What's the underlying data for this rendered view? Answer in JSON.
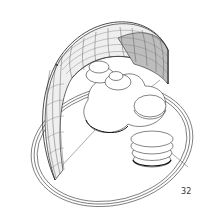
{
  "figure": {
    "number": "32",
    "colors": {
      "line": "#2a2a2a",
      "grid_light": "#9a9a9a",
      "shade_light": "#ececec",
      "shade_dark": "#bdbdbd",
      "background": "#ffffff"
    }
  }
}
